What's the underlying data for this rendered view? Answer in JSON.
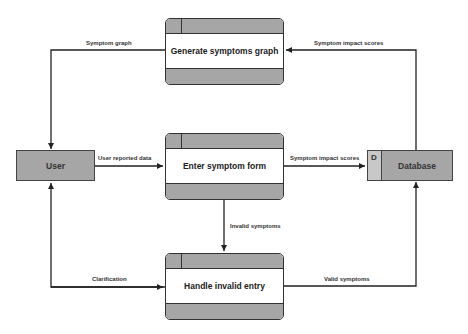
{
  "diagram": {
    "type": "data-flow-diagram",
    "entities": [
      {
        "id": "user",
        "label": "User"
      }
    ],
    "processes": [
      {
        "id": "generate",
        "label": "Generate symptoms graph"
      },
      {
        "id": "enter",
        "label": "Enter symptom form"
      },
      {
        "id": "handle",
        "label": "Handle invalid entry"
      }
    ],
    "stores": [
      {
        "id": "db",
        "tag": "D",
        "label": "Database"
      }
    ],
    "flows": [
      {
        "from": "generate",
        "to": "user",
        "label": "Symptom  graph"
      },
      {
        "from": "db",
        "to": "generate",
        "label": "Symptom  impact scores"
      },
      {
        "from": "user",
        "to": "enter",
        "label": "User reported  data"
      },
      {
        "from": "enter",
        "to": "db",
        "label": "Symptom  impact scores"
      },
      {
        "from": "enter",
        "to": "handle",
        "label": "Invalid symptoms"
      },
      {
        "from": "handle",
        "to": "user",
        "label": "Clarification"
      },
      {
        "from": "handle",
        "to": "db",
        "label": "Valid symptoms"
      }
    ]
  },
  "colors": {
    "box_fill": "#a6a6a6",
    "store_id_fill": "#c8c8c8",
    "line": "#222222",
    "process_body": "#ffffff"
  }
}
